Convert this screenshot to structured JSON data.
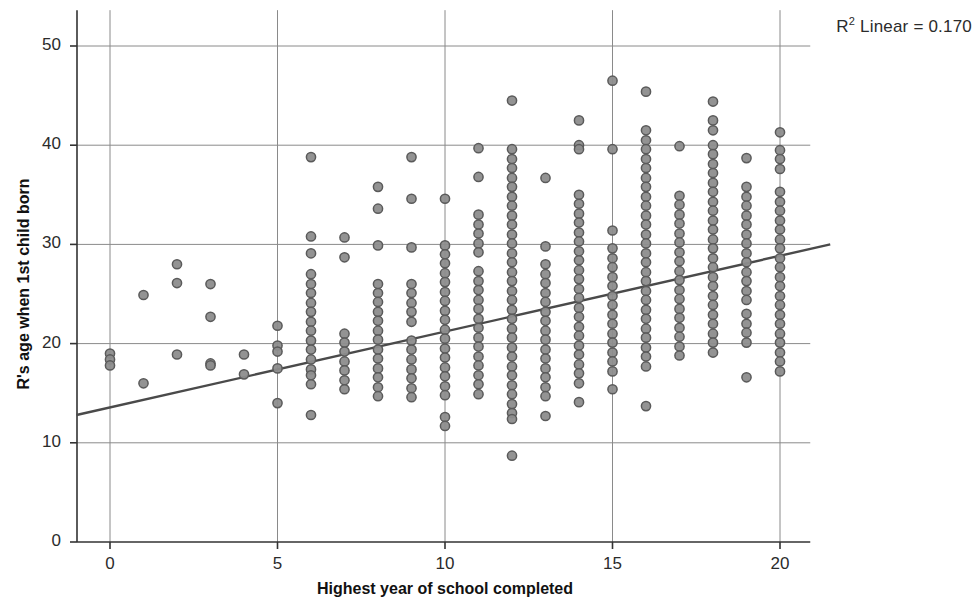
{
  "annotations": {
    "r2_prefix": "R",
    "r2_sup": "2",
    "r2_text": " Linear = 0.170"
  },
  "axes": {
    "y_title": "R's age when 1st child born",
    "x_title": "Highest year of school completed",
    "y_ticks": [
      "0",
      "10",
      "20",
      "30",
      "40",
      "50"
    ],
    "x_ticks": [
      "0",
      "5",
      "10",
      "15",
      "20"
    ]
  },
  "style": {
    "marker_fill": "#8d8d8d",
    "marker_stroke": "#5a5a5a",
    "grid_color": "#8a8a8a",
    "axis_color": "#333333",
    "fit_line_color": "#4a4a4a",
    "background": "#ffffff"
  },
  "chart_data": {
    "type": "scatter",
    "title": "",
    "xlabel": "Highest year of school completed",
    "ylabel": "R's age when 1st child born",
    "xlim": [
      -1.0,
      21.5
    ],
    "ylim": [
      0,
      52
    ],
    "xticks": [
      0,
      5,
      10,
      15,
      20
    ],
    "yticks": [
      0,
      10,
      20,
      30,
      40,
      50
    ],
    "grid": true,
    "legend": false,
    "r_squared_linear": 0.17,
    "fit_line": {
      "type": "linear",
      "x": [
        -1.0,
        21.5
      ],
      "y": [
        12.8,
        30.0
      ],
      "slope": 0.765,
      "intercept": 13.56
    },
    "points": [
      [
        0,
        19.0
      ],
      [
        0,
        18.4
      ],
      [
        0,
        17.8
      ],
      [
        1,
        24.9
      ],
      [
        1,
        16.0
      ],
      [
        2,
        28.0
      ],
      [
        2,
        26.1
      ],
      [
        2,
        18.9
      ],
      [
        3,
        26.0
      ],
      [
        3,
        22.7
      ],
      [
        3,
        18.0
      ],
      [
        3,
        17.8
      ],
      [
        4,
        18.9
      ],
      [
        4,
        16.9
      ],
      [
        5,
        21.8
      ],
      [
        5,
        19.8
      ],
      [
        5,
        19.2
      ],
      [
        5,
        17.5
      ],
      [
        5,
        14.0
      ],
      [
        6,
        38.8
      ],
      [
        6,
        30.8
      ],
      [
        6,
        29.1
      ],
      [
        6,
        27.0
      ],
      [
        6,
        26.0
      ],
      [
        6,
        25.1
      ],
      [
        6,
        24.1
      ],
      [
        6,
        23.2
      ],
      [
        6,
        22.2
      ],
      [
        6,
        21.3
      ],
      [
        6,
        20.3
      ],
      [
        6,
        19.4
      ],
      [
        6,
        18.4
      ],
      [
        6,
        17.4
      ],
      [
        6,
        16.8
      ],
      [
        6,
        15.9
      ],
      [
        6,
        12.8
      ],
      [
        7,
        30.7
      ],
      [
        7,
        28.7
      ],
      [
        7,
        21.0
      ],
      [
        7,
        20.1
      ],
      [
        7,
        19.2
      ],
      [
        7,
        18.2
      ],
      [
        7,
        17.3
      ],
      [
        7,
        16.3
      ],
      [
        7,
        15.4
      ],
      [
        8,
        35.8
      ],
      [
        8,
        33.6
      ],
      [
        8,
        29.9
      ],
      [
        8,
        26.0
      ],
      [
        8,
        25.1
      ],
      [
        8,
        24.2
      ],
      [
        8,
        23.2
      ],
      [
        8,
        22.3
      ],
      [
        8,
        21.3
      ],
      [
        8,
        20.4
      ],
      [
        8,
        19.4
      ],
      [
        8,
        18.5
      ],
      [
        8,
        17.5
      ],
      [
        8,
        16.6
      ],
      [
        8,
        15.6
      ],
      [
        8,
        14.7
      ],
      [
        9,
        38.8
      ],
      [
        9,
        34.6
      ],
      [
        9,
        29.7
      ],
      [
        9,
        26.0
      ],
      [
        9,
        25.1
      ],
      [
        9,
        24.1
      ],
      [
        9,
        23.2
      ],
      [
        9,
        22.2
      ],
      [
        9,
        20.3
      ],
      [
        9,
        19.4
      ],
      [
        9,
        18.4
      ],
      [
        9,
        17.4
      ],
      [
        9,
        16.5
      ],
      [
        9,
        15.5
      ],
      [
        9,
        14.6
      ],
      [
        10,
        34.6
      ],
      [
        10,
        29.9
      ],
      [
        10,
        29.0
      ],
      [
        10,
        28.1
      ],
      [
        10,
        27.1
      ],
      [
        10,
        26.2
      ],
      [
        10,
        25.2
      ],
      [
        10,
        24.3
      ],
      [
        10,
        23.3
      ],
      [
        10,
        22.4
      ],
      [
        10,
        21.4
      ],
      [
        10,
        20.5
      ],
      [
        10,
        19.5
      ],
      [
        10,
        18.6
      ],
      [
        10,
        17.6
      ],
      [
        10,
        16.7
      ],
      [
        10,
        15.7
      ],
      [
        10,
        14.8
      ],
      [
        10,
        12.6
      ],
      [
        10,
        11.7
      ],
      [
        11,
        39.7
      ],
      [
        11,
        36.8
      ],
      [
        11,
        33.0
      ],
      [
        11,
        32.0
      ],
      [
        11,
        31.1
      ],
      [
        11,
        30.1
      ],
      [
        11,
        29.2
      ],
      [
        11,
        27.3
      ],
      [
        11,
        26.3
      ],
      [
        11,
        25.4
      ],
      [
        11,
        24.4
      ],
      [
        11,
        23.5
      ],
      [
        11,
        22.5
      ],
      [
        11,
        21.6
      ],
      [
        11,
        20.6
      ],
      [
        11,
        19.7
      ],
      [
        11,
        18.7
      ],
      [
        11,
        17.8
      ],
      [
        11,
        16.8
      ],
      [
        11,
        15.9
      ],
      [
        11,
        14.9
      ],
      [
        12,
        44.5
      ],
      [
        12,
        39.6
      ],
      [
        12,
        38.6
      ],
      [
        12,
        37.7
      ],
      [
        12,
        36.7
      ],
      [
        12,
        35.8
      ],
      [
        12,
        34.8
      ],
      [
        12,
        33.9
      ],
      [
        12,
        32.9
      ],
      [
        12,
        32.0
      ],
      [
        12,
        31.0
      ],
      [
        12,
        30.1
      ],
      [
        12,
        29.1
      ],
      [
        12,
        28.2
      ],
      [
        12,
        27.2
      ],
      [
        12,
        26.3
      ],
      [
        12,
        25.3
      ],
      [
        12,
        24.4
      ],
      [
        12,
        23.4
      ],
      [
        12,
        22.5
      ],
      [
        12,
        21.5
      ],
      [
        12,
        20.6
      ],
      [
        12,
        19.6
      ],
      [
        12,
        18.7
      ],
      [
        12,
        17.7
      ],
      [
        12,
        16.8
      ],
      [
        12,
        15.8
      ],
      [
        12,
        14.9
      ],
      [
        12,
        13.9
      ],
      [
        12,
        13.0
      ],
      [
        12,
        12.4
      ],
      [
        12,
        8.7
      ],
      [
        13,
        36.7
      ],
      [
        13,
        29.8
      ],
      [
        13,
        28.0
      ],
      [
        13,
        27.0
      ],
      [
        13,
        26.1
      ],
      [
        13,
        25.1
      ],
      [
        13,
        24.2
      ],
      [
        13,
        23.2
      ],
      [
        13,
        22.3
      ],
      [
        13,
        21.3
      ],
      [
        13,
        20.4
      ],
      [
        13,
        19.4
      ],
      [
        13,
        18.5
      ],
      [
        13,
        17.5
      ],
      [
        13,
        16.6
      ],
      [
        13,
        15.6
      ],
      [
        13,
        14.7
      ],
      [
        13,
        12.7
      ],
      [
        14,
        42.5
      ],
      [
        14,
        40.0
      ],
      [
        14,
        39.6
      ],
      [
        14,
        35.0
      ],
      [
        14,
        34.1
      ],
      [
        14,
        33.1
      ],
      [
        14,
        32.2
      ],
      [
        14,
        31.2
      ],
      [
        14,
        30.3
      ],
      [
        14,
        29.3
      ],
      [
        14,
        28.4
      ],
      [
        14,
        27.4
      ],
      [
        14,
        26.5
      ],
      [
        14,
        25.5
      ],
      [
        14,
        24.6
      ],
      [
        14,
        23.6
      ],
      [
        14,
        22.7
      ],
      [
        14,
        21.7
      ],
      [
        14,
        20.8
      ],
      [
        14,
        19.8
      ],
      [
        14,
        18.9
      ],
      [
        14,
        17.9
      ],
      [
        14,
        17.0
      ],
      [
        14,
        16.0
      ],
      [
        14,
        14.1
      ],
      [
        15,
        46.5
      ],
      [
        15,
        39.6
      ],
      [
        15,
        31.4
      ],
      [
        15,
        29.6
      ],
      [
        15,
        28.6
      ],
      [
        15,
        27.7
      ],
      [
        15,
        26.7
      ],
      [
        15,
        25.8
      ],
      [
        15,
        24.8
      ],
      [
        15,
        23.9
      ],
      [
        15,
        22.9
      ],
      [
        15,
        22.0
      ],
      [
        15,
        21.0
      ],
      [
        15,
        20.1
      ],
      [
        15,
        19.1
      ],
      [
        15,
        18.2
      ],
      [
        15,
        17.2
      ],
      [
        15,
        15.4
      ],
      [
        16,
        45.4
      ],
      [
        16,
        41.5
      ],
      [
        16,
        40.5
      ],
      [
        16,
        39.6
      ],
      [
        16,
        38.6
      ],
      [
        16,
        37.7
      ],
      [
        16,
        36.7
      ],
      [
        16,
        35.8
      ],
      [
        16,
        34.8
      ],
      [
        16,
        33.9
      ],
      [
        16,
        32.9
      ],
      [
        16,
        32.0
      ],
      [
        16,
        31.0
      ],
      [
        16,
        30.1
      ],
      [
        16,
        29.1
      ],
      [
        16,
        28.2
      ],
      [
        16,
        27.2
      ],
      [
        16,
        26.3
      ],
      [
        16,
        25.3
      ],
      [
        16,
        24.4
      ],
      [
        16,
        23.4
      ],
      [
        16,
        22.5
      ],
      [
        16,
        21.5
      ],
      [
        16,
        20.6
      ],
      [
        16,
        19.6
      ],
      [
        16,
        18.7
      ],
      [
        16,
        17.7
      ],
      [
        16,
        13.7
      ],
      [
        17,
        39.9
      ],
      [
        17,
        34.9
      ],
      [
        17,
        34.0
      ],
      [
        17,
        33.0
      ],
      [
        17,
        32.1
      ],
      [
        17,
        31.1
      ],
      [
        17,
        30.2
      ],
      [
        17,
        29.2
      ],
      [
        17,
        28.3
      ],
      [
        17,
        27.3
      ],
      [
        17,
        26.4
      ],
      [
        17,
        25.4
      ],
      [
        17,
        24.5
      ],
      [
        17,
        23.5
      ],
      [
        17,
        22.6
      ],
      [
        17,
        21.6
      ],
      [
        17,
        20.7
      ],
      [
        17,
        19.7
      ],
      [
        17,
        18.8
      ],
      [
        18,
        44.4
      ],
      [
        18,
        42.5
      ],
      [
        18,
        41.5
      ],
      [
        18,
        40.0
      ],
      [
        18,
        39.1
      ],
      [
        18,
        38.1
      ],
      [
        18,
        37.2
      ],
      [
        18,
        36.2
      ],
      [
        18,
        35.3
      ],
      [
        18,
        34.3
      ],
      [
        18,
        33.4
      ],
      [
        18,
        32.4
      ],
      [
        18,
        31.5
      ],
      [
        18,
        30.5
      ],
      [
        18,
        29.6
      ],
      [
        18,
        28.6
      ],
      [
        18,
        27.7
      ],
      [
        18,
        26.7
      ],
      [
        18,
        25.8
      ],
      [
        18,
        24.8
      ],
      [
        18,
        23.9
      ],
      [
        18,
        22.9
      ],
      [
        18,
        22.0
      ],
      [
        18,
        21.0
      ],
      [
        18,
        20.1
      ],
      [
        18,
        19.1
      ],
      [
        19,
        38.7
      ],
      [
        19,
        35.8
      ],
      [
        19,
        34.8
      ],
      [
        19,
        33.9
      ],
      [
        19,
        32.9
      ],
      [
        19,
        32.0
      ],
      [
        19,
        31.0
      ],
      [
        19,
        30.1
      ],
      [
        19,
        29.1
      ],
      [
        19,
        28.2
      ],
      [
        19,
        27.2
      ],
      [
        19,
        26.3
      ],
      [
        19,
        25.3
      ],
      [
        19,
        24.4
      ],
      [
        19,
        23.0
      ],
      [
        19,
        22.0
      ],
      [
        19,
        21.1
      ],
      [
        19,
        20.1
      ],
      [
        19,
        16.6
      ],
      [
        20,
        41.3
      ],
      [
        20,
        39.5
      ],
      [
        20,
        38.6
      ],
      [
        20,
        37.6
      ],
      [
        20,
        35.3
      ],
      [
        20,
        34.3
      ],
      [
        20,
        33.4
      ],
      [
        20,
        32.4
      ],
      [
        20,
        31.5
      ],
      [
        20,
        30.5
      ],
      [
        20,
        29.6
      ],
      [
        20,
        28.6
      ],
      [
        20,
        27.7
      ],
      [
        20,
        26.7
      ],
      [
        20,
        25.8
      ],
      [
        20,
        24.8
      ],
      [
        20,
        23.9
      ],
      [
        20,
        22.9
      ],
      [
        20,
        22.0
      ],
      [
        20,
        21.0
      ],
      [
        20,
        20.1
      ],
      [
        20,
        19.1
      ],
      [
        20,
        18.2
      ],
      [
        20,
        17.2
      ]
    ]
  }
}
